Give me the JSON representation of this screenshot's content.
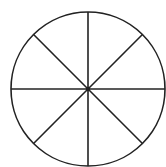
{
  "diagram": {
    "type": "divided-circle",
    "sectors": 8,
    "center": {
      "x": 88,
      "y": 89
    },
    "radius": 77,
    "center_dot_radius": 2.2,
    "stroke_color": "#222222",
    "stroke_width": 1.6,
    "background_color": "#ffffff",
    "diameter_angles_deg": [
      0,
      45,
      90,
      135
    ]
  }
}
